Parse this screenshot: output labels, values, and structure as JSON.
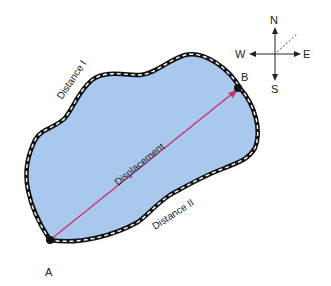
{
  "diagram": {
    "type": "distance-vs-displacement",
    "region_fill": "#a8c8ee",
    "displacement_color": "#cc3366",
    "points": {
      "start": {
        "label": "A"
      },
      "end": {
        "label": "B"
      }
    },
    "path_labels": {
      "upper": "Distance I",
      "lower": "Distance II",
      "vector": "Displacement"
    },
    "compass": {
      "north": "N",
      "south": "S",
      "east": "E",
      "west": "W"
    }
  }
}
